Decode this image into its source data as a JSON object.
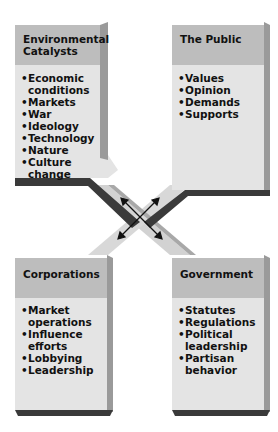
{
  "panels": {
    "environmental": {
      "title": "Environmental Catalysts",
      "items": [
        "Economic conditions",
        "Markets",
        "War",
        "Ideology",
        "Technology",
        "Nature",
        "Culture change"
      ]
    },
    "public": {
      "title": "The Public",
      "items": [
        "Values",
        "Opinion",
        "Demands",
        "Supports"
      ]
    },
    "corporations": {
      "title": "Corporations",
      "items": [
        "Market operations",
        "Influence efforts",
        "Lobbying",
        "Leadership"
      ]
    },
    "government": {
      "title": "Government",
      "items": [
        "Statutes",
        "Regulations",
        "Political leadership",
        "Partisan behavior"
      ]
    }
  },
  "colors": {
    "header": "#bdbdbd",
    "body": "#e4e4e4",
    "edge_dark": "#3a3a3a",
    "edge_side": "#9a9a9a",
    "connector": "#d2d2d2"
  }
}
